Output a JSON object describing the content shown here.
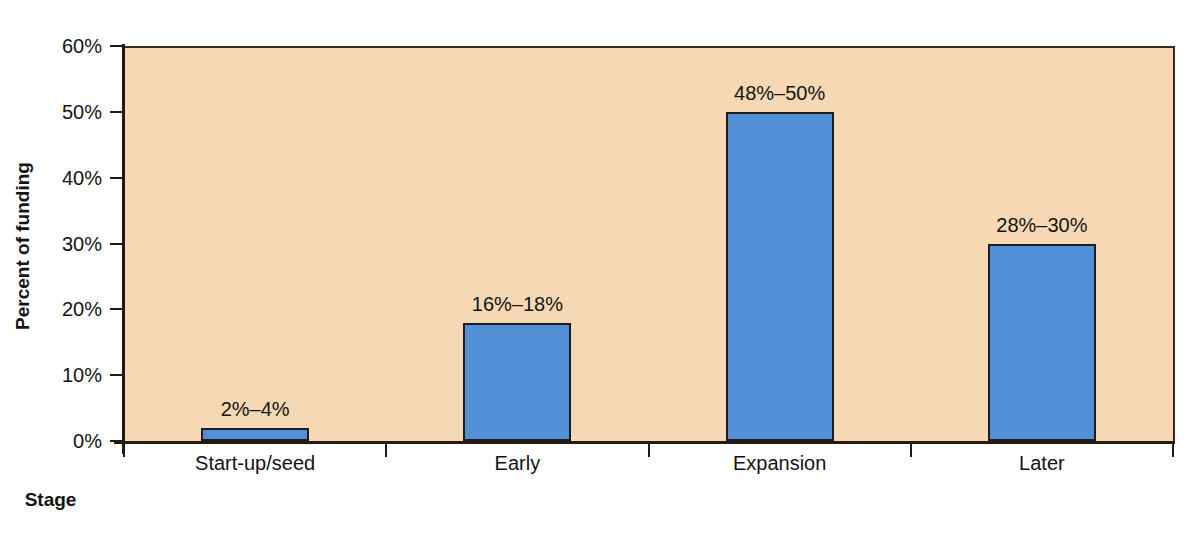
{
  "chart_data": {
    "type": "bar",
    "title": "",
    "xlabel": "Stage",
    "ylabel": "Percent of funding",
    "categories": [
      "Start-up/seed",
      "Early",
      "Expansion",
      "Later"
    ],
    "values": [
      2,
      18,
      50,
      30
    ],
    "value_labels": [
      "2%–4%",
      "16%–18%",
      "48%–50%",
      "28%–30%"
    ],
    "ranges": [
      [
        2,
        4
      ],
      [
        16,
        18
      ],
      [
        48,
        50
      ],
      [
        28,
        30
      ]
    ],
    "ylim": [
      0,
      60
    ],
    "ytick_values": [
      0,
      10,
      20,
      30,
      40,
      50,
      60
    ],
    "ytick_labels": [
      "0%",
      "10%",
      "20%",
      "30%",
      "40%",
      "50%",
      "60%"
    ],
    "grid": false,
    "legend": null,
    "plot_background_color": "#f7d8b4",
    "bar_color": "#528fd6",
    "bar_border_color": "#1d1d1d",
    "axis_color": "#231a12",
    "figure_background_color": "#ffffff"
  },
  "axes": {
    "y_title": "Percent of funding",
    "x_title": "Stage"
  }
}
